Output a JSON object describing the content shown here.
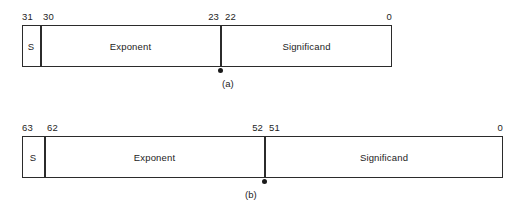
{
  "figure": {
    "background_color": "#ffffff",
    "line_color": "#2b2b2b",
    "text_color": "#232323"
  },
  "formats": [
    {
      "id": "single-precision",
      "caption": "(a)",
      "bit_labels": {
        "msb": "31",
        "exponent_msb": "30",
        "exponent_lsb": "23",
        "significand_msb": "22",
        "lsb": "0"
      },
      "fields": [
        {
          "name": "sign",
          "label": "S"
        },
        {
          "name": "exponent",
          "label": "Exponent"
        },
        {
          "name": "significand",
          "label": "Significand"
        }
      ]
    },
    {
      "id": "double-precision",
      "caption": "(b)",
      "bit_labels": {
        "msb": "63",
        "exponent_msb": "62",
        "exponent_lsb": "52",
        "significand_msb": "51",
        "lsb": "0"
      },
      "fields": [
        {
          "name": "sign",
          "label": "S"
        },
        {
          "name": "exponent",
          "label": "Exponent"
        },
        {
          "name": "significand",
          "label": "Significand"
        }
      ]
    }
  ]
}
